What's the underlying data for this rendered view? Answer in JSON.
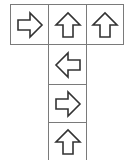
{
  "grid": {
    "cell_size": 38,
    "line_color": "#7a7a7a",
    "arrow_stroke": "#333333",
    "cells": [
      {
        "row": 0,
        "col": 0,
        "arrow": "right-arrow-icon",
        "direction": "right"
      },
      {
        "row": 0,
        "col": 1,
        "arrow": "up-arrow-icon",
        "direction": "up"
      },
      {
        "row": 0,
        "col": 2,
        "arrow": "up-arrow-icon",
        "direction": "up"
      },
      {
        "row": 1,
        "col": 1,
        "arrow": "left-arrow-icon",
        "direction": "left"
      },
      {
        "row": 2,
        "col": 1,
        "arrow": "right-arrow-icon",
        "direction": "right"
      },
      {
        "row": 3,
        "col": 1,
        "arrow": "up-arrow-icon",
        "direction": "up"
      }
    ]
  }
}
